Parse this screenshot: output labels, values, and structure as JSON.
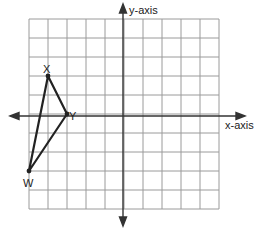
{
  "diagram": {
    "type": "coordinate-grid",
    "grid": {
      "columns": 10,
      "rows": 10,
      "x_range": [
        -5,
        5
      ],
      "y_range": [
        -5,
        5
      ]
    },
    "axes": {
      "x_label": "x-axis",
      "y_label": "y-axis"
    },
    "triangle": {
      "vertices": [
        {
          "name": "X",
          "x": -4,
          "y": 2
        },
        {
          "name": "Y",
          "x": -3,
          "y": 0
        },
        {
          "name": "W",
          "x": -5,
          "y": -3
        }
      ]
    },
    "colors": {
      "grid": "#9a9a9a",
      "axis": "#333333",
      "triangle": "#222222",
      "background": "#ffffff"
    }
  }
}
